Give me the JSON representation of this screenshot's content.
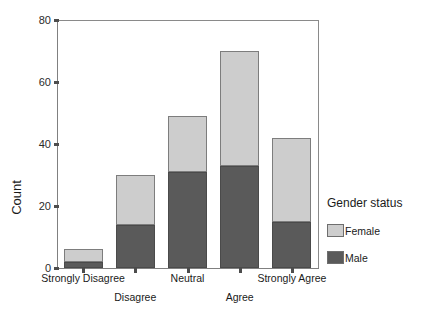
{
  "chart_data": {
    "type": "bar",
    "title": "",
    "xlabel": "",
    "ylabel": "Count",
    "ylim": [
      0,
      80
    ],
    "yticks": [
      0,
      20,
      40,
      60,
      80
    ],
    "grid": false,
    "stacked": true,
    "legend_position": "right",
    "legend_title": "Gender status",
    "categories": [
      "Strongly Disagree",
      "Disagree",
      "Neutral",
      "Agree",
      "Strongly Agree"
    ],
    "series": [
      {
        "name": "Male",
        "color": "#5a5a5a",
        "values": [
          2,
          14,
          31,
          33,
          15
        ]
      },
      {
        "name": "Female",
        "color": "#cdcdcd",
        "values": [
          4,
          16,
          18,
          37,
          27
        ]
      }
    ],
    "totals": [
      6,
      30,
      49,
      70,
      42
    ]
  },
  "axis": {
    "y_title": "Count",
    "y_tick_labels": [
      "0",
      "20",
      "40",
      "60",
      "80"
    ],
    "x_tick_labels": [
      "Strongly Disagree",
      "Disagree",
      "Neutral",
      "Agree",
      "Strongly Agree"
    ]
  },
  "legend": {
    "title": "Gender status",
    "items": [
      {
        "label": "Female",
        "color": "#cdcdcd"
      },
      {
        "label": "Male",
        "color": "#5a5a5a"
      }
    ]
  }
}
